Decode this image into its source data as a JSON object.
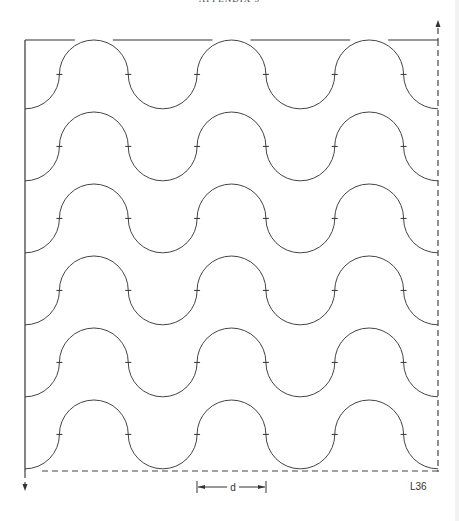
{
  "header": {
    "text": "APPENDIX 5"
  },
  "diagram": {
    "rows": 6,
    "crests_per_row": 3,
    "dimension_label": "d",
    "figure_code": "L36",
    "line_color": "#444444"
  }
}
